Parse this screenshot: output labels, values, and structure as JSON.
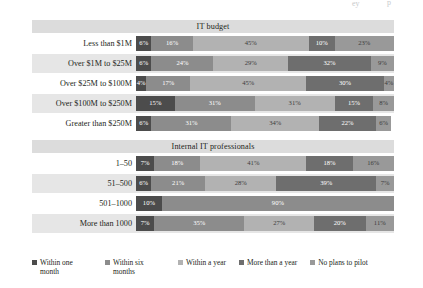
{
  "artifacts": {
    "mark1": "ey",
    "mark2": "p"
  },
  "legend": {
    "items": [
      {
        "label": "Within one month",
        "color": "#4c4c4c"
      },
      {
        "label": "Within six months",
        "color": "#8c8c8c"
      },
      {
        "label": "Within a year",
        "color": "#b2b2b2"
      },
      {
        "label": "More than a year",
        "color": "#6e6e6e"
      },
      {
        "label": "No plans to pilot",
        "color": "#999999"
      }
    ]
  },
  "chart_data": {
    "type": "bar",
    "orientation": "horizontal",
    "stacked": true,
    "units": "percent",
    "xlim": [
      0,
      100
    ],
    "grid": false,
    "legend_position": "bottom",
    "title": "",
    "xlabel": "",
    "ylabel": "",
    "series": [
      {
        "name": "Within one month",
        "color": "#4c4c4c"
      },
      {
        "name": "Within six months",
        "color": "#8c8c8c"
      },
      {
        "name": "Within a year",
        "color": "#b2b2b2"
      },
      {
        "name": "More than a year",
        "color": "#6e6e6e"
      },
      {
        "name": "No plans to pilot",
        "color": "#999999"
      }
    ],
    "sections": [
      {
        "title": "IT budget",
        "categories": [
          {
            "label": "Less than $1M",
            "values": [
              6,
              16,
              45,
              10,
              23
            ],
            "labels": [
              "6%",
              "16%",
              "45%",
              "10%",
              "23%"
            ]
          },
          {
            "label": "Over $1M to $25M",
            "values": [
              6,
              24,
              29,
              32,
              9
            ],
            "labels": [
              "6%",
              "24%",
              "29%",
              "32%",
              "9%"
            ]
          },
          {
            "label": "Over $25M to $100M",
            "values": [
              4,
              17,
              45,
              30,
              4
            ],
            "labels": [
              "4%",
              "17%",
              "45%",
              "30%",
              "4%"
            ]
          },
          {
            "label": "Over $100M to $250M",
            "values": [
              15,
              31,
              31,
              15,
              8
            ],
            "labels": [
              "15%",
              "31%",
              "31%",
              "15%",
              "8%"
            ]
          },
          {
            "label": "Greater than $250M",
            "values": [
              6,
              31,
              34,
              22,
              6
            ],
            "labels": [
              "6%",
              "31%",
              "34%",
              "22%",
              "6%"
            ]
          }
        ]
      },
      {
        "title": "Internal IT professionals",
        "categories": [
          {
            "label": "1–50",
            "values": [
              7,
              18,
              41,
              18,
              16
            ],
            "labels": [
              "7%",
              "18%",
              "41%",
              "18%",
              "16%"
            ]
          },
          {
            "label": "51–500",
            "values": [
              6,
              21,
              28,
              39,
              7
            ],
            "labels": [
              "6%",
              "21%",
              "28%",
              "39%",
              "7%"
            ]
          },
          {
            "label": "501–1000",
            "values": [
              10,
              90,
              0,
              0,
              0
            ],
            "labels": [
              "10%",
              "90%",
              "",
              "",
              ""
            ]
          },
          {
            "label": "More than 1000",
            "values": [
              7,
              35,
              27,
              20,
              11
            ],
            "labels": [
              "7%",
              "35%",
              "27%",
              "20%",
              "11%"
            ]
          }
        ]
      }
    ]
  }
}
